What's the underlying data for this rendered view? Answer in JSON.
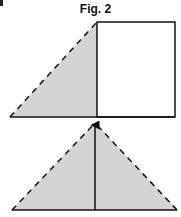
{
  "figure": {
    "title": "Fig. 2",
    "colors": {
      "fill": "#d4d4d4",
      "stroke": "#111111",
      "background": "#ffffff"
    },
    "panels": [
      {
        "name": "top-panel",
        "description": "Right triangle (shaded, dashed hypotenuse) adjoining an open square on its right",
        "shapes": [
          "shaded-right-triangle",
          "square"
        ]
      },
      {
        "name": "bottom-panel",
        "description": "Shaded isosceles triangle with dashed sides and a vertical arrow from base midpoint to apex",
        "shapes": [
          "shaded-isosceles-triangle",
          "vertical-arrow"
        ]
      }
    ]
  }
}
